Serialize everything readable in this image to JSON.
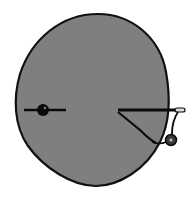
{
  "diagram": {
    "description": "Gray rounded blob outline with a dot-on-line marker at left and a wedge/hook attachment with small circle at right",
    "colors": {
      "background": "#ffffff",
      "blob_fill": "#7f7f7f",
      "outline": "#111111",
      "marker": "#0a0a0a",
      "hook_circle_fill": "#3a3a3a",
      "hook_circle_center": "#bbbbbb"
    },
    "elements": {
      "blob": {
        "label": "blob-shape"
      },
      "left_marker": {
        "label": "left-dot-marker",
        "cx": 43,
        "cy": 110,
        "r": 6,
        "line_x1": 24,
        "line_x2": 66,
        "line_y": 110
      },
      "right_hook": {
        "label": "right-hook-attachment",
        "line_x1": 118,
        "line_x2": 185,
        "line_y": 110,
        "circle_cx": 171,
        "circle_cy": 140,
        "circle_r": 5
      }
    }
  }
}
